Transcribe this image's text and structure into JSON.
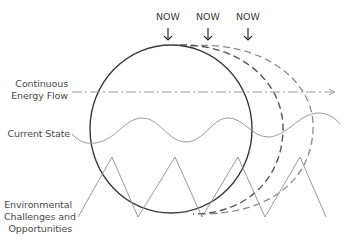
{
  "diagram": {
    "markers": [
      {
        "label": "NOW",
        "x": 168
      },
      {
        "label": "NOW",
        "x": 208
      },
      {
        "label": "NOW",
        "x": 248
      }
    ],
    "labels": {
      "energy_flow_line1": "Continuous",
      "energy_flow_line2": "Energy Flow",
      "current_state": "Current State",
      "env_line1": "Environmental",
      "env_line2": "Challenges and",
      "env_line3": "Opportunities"
    },
    "elements": {
      "main_circle": "solid",
      "future_circle_1": "dashed",
      "future_circle_2": "dashed",
      "energy_flow_line": "dash-dot arrow",
      "current_state_wave": "sine wave",
      "environment_zigzag": "triangle wave"
    },
    "colors": {
      "main_circle": "#3a3a3a",
      "dashed_circle_1": "#555555",
      "dashed_circle_2": "#8a8a8a",
      "lines": "#9a9a9a",
      "text": "#4a4a4a"
    }
  }
}
